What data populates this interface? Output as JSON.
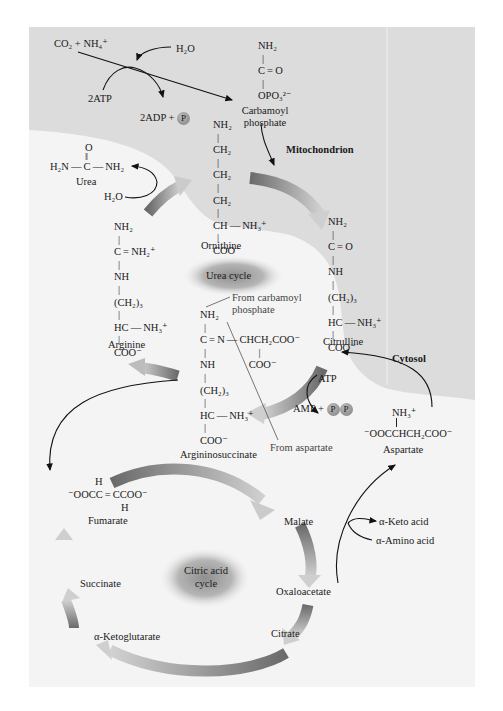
{
  "compartments": {
    "mitochondrion": "Mitochondrion",
    "cytosol": "Cytosol"
  },
  "cycles": {
    "urea": "Urea cycle",
    "citric_line1": "Citric acid",
    "citric_line2": "cycle"
  },
  "top_reaction": {
    "reactants": "CO₂ + NH₄⁺",
    "water": "H₂O",
    "atp": "2ATP",
    "adp": "2ADP +",
    "p_symbol": "P"
  },
  "carbamoyl_phosphate": {
    "lines": [
      "NH₂",
      "|",
      "C = O",
      "|",
      "OPO₃²⁻"
    ],
    "name_line1": "Carbamoyl",
    "name_line2": "phosphate"
  },
  "ornithine": {
    "lines": [
      "NH₂",
      "|",
      "CH₂",
      "|",
      "CH₂",
      "|",
      "CH₂",
      "|",
      "CH — NH₃⁺",
      "|",
      "COO⁻"
    ],
    "name": "Ornithine"
  },
  "urea": {
    "top": "O",
    "dbl": "‖",
    "formula": "H₂N — C — NH₂",
    "name": "Urea",
    "water": "H₂O"
  },
  "citrulline": {
    "lines": [
      "NH₂",
      "|",
      "C = O",
      "|",
      "NH",
      "|",
      "(CH₂)₃",
      "|",
      "HC — NH₃⁺",
      "|",
      "COO⁻"
    ],
    "name": "Citrulline"
  },
  "arginine": {
    "lines": [
      "NH₂",
      "|",
      "C = NH₂⁺",
      "|",
      "NH",
      "|",
      "(CH₂)₃",
      "|",
      "HC — NH₃⁺",
      "|",
      "COO⁻"
    ],
    "name": "Arginine"
  },
  "argininosuccinate": {
    "lines": [
      "NH₂",
      "|",
      "C = N — CHCH₂COO⁻",
      "|     |",
      "NH    COO⁻",
      "|",
      "(CH₂)₃",
      "|",
      "HC — NH₃⁺",
      "|",
      "COO⁻"
    ],
    "name": "Argininosuccinate",
    "from_carbamoyl_line1": "From carbamoyl",
    "from_carbamoyl_line2": "phosphate",
    "from_aspartate": "From aspartate"
  },
  "atp_step": {
    "atp": "ATP",
    "amp": "AMP +",
    "p1": "P",
    "p2": "P"
  },
  "aspartate": {
    "nh3": "NH₃⁺",
    "formula": "⁻OOCCHCH₂COO⁻",
    "name": "Aspartate"
  },
  "fumarate": {
    "h_top": "H",
    "formula": "⁻OOCC = CCOO⁻",
    "h_bottom": "H",
    "name": "Fumarate"
  },
  "citric_acid_cycle": {
    "malate": "Malate",
    "oxaloacetate": "Oxaloacetate",
    "citrate": "Citrate",
    "alpha_ketoglutarate": "α-Ketoglutarate",
    "succinate": "Succinate"
  },
  "transamination": {
    "keto_acid": "α-Keto acid",
    "amino_acid": "α-Amino acid"
  },
  "colors": {
    "mitochondrion_bg": "#dcdcdc",
    "cytosol_bg": "#f4f4f4",
    "arrow_dark": "#6e6e6e",
    "arrow_light": "#c8c8c8"
  }
}
